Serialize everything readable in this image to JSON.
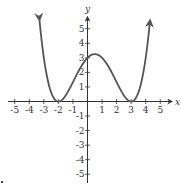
{
  "chart_data": {
    "type": "line",
    "title": "",
    "xlabel": "x",
    "ylabel": "y",
    "xlim": [
      -5.5,
      5.8
    ],
    "ylim": [
      -5.5,
      6.2
    ],
    "x_ticks": [
      -5,
      -4,
      -3,
      -2,
      -1,
      1,
      2,
      3,
      4,
      5
    ],
    "y_ticks": [
      -5,
      -4,
      -3,
      -2,
      -1,
      1,
      2,
      3,
      4,
      5
    ],
    "x_tick_labels": [
      "-5",
      "-4",
      "-3",
      "-2",
      "-1",
      "1",
      "2",
      "3",
      "4",
      "5"
    ],
    "y_tick_labels": [
      "-5",
      "-4",
      "-3",
      "-2",
      "-1",
      "1",
      "2",
      "3",
      "4",
      "5"
    ],
    "grid": false,
    "legend": null,
    "series": [
      {
        "name": "f(x)",
        "description": "Quartic polynomial with double roots at x=-2 and x=3, y-intercept 3, arrows at both ends pointing up",
        "x": [
          -3.3,
          -3.0,
          -2.5,
          -2.0,
          -1.5,
          -1.0,
          -0.5,
          0.0,
          0.5,
          1.0,
          1.5,
          2.0,
          2.5,
          3.0,
          3.5,
          4.0,
          4.3
        ],
        "values": [
          5.59,
          3.0,
          0.63,
          0.0,
          0.42,
          1.33,
          2.34,
          3.0,
          3.26,
          3.0,
          2.34,
          1.33,
          0.42,
          0.0,
          0.63,
          3.0,
          5.59
        ]
      }
    ],
    "key_points": {
      "roots": [
        -2,
        3
      ],
      "y_intercept": 3,
      "local_max": [
        0.5,
        3.26
      ]
    }
  },
  "axes": {
    "x_label": "x",
    "y_label": "y"
  },
  "colors": {
    "curve": "#555555",
    "axis": "#333333",
    "text": "#333333"
  }
}
